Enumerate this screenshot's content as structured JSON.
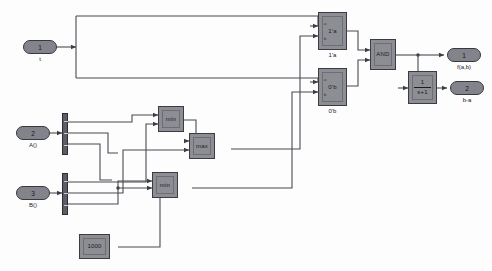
{
  "diagram": {
    "background": "#fdfdfd",
    "block_fill": "#8d8d94",
    "block_stroke": "#3b3b42",
    "wire_color": "#4a4a52"
  },
  "inputs": [
    {
      "id": "in1",
      "port_number": "1",
      "caption": "t"
    },
    {
      "id": "in2",
      "port_number": "2",
      "caption": "A()"
    },
    {
      "id": "in3",
      "port_number": "3",
      "caption": "B()"
    }
  ],
  "outputs": [
    {
      "id": "out1",
      "port_number": "1",
      "caption": "f(a,b)"
    },
    {
      "id": "out2",
      "port_number": "2",
      "caption": "b-a"
    }
  ],
  "blocks": [
    {
      "id": "rel_top",
      "label": "1'a",
      "caption": "1'a",
      "type": "relational"
    },
    {
      "id": "rel_bot",
      "label": "0'b",
      "caption": "0'b",
      "type": "relational"
    },
    {
      "id": "and",
      "label": "AND",
      "caption": "",
      "type": "logic"
    },
    {
      "id": "min_top",
      "label": "min",
      "caption": "",
      "type": "minmax"
    },
    {
      "id": "max_mid",
      "label": "max",
      "caption": "",
      "type": "minmax"
    },
    {
      "id": "min_bot",
      "label": "min",
      "caption": "",
      "type": "minmax"
    },
    {
      "id": "const",
      "label": "1000",
      "caption": "",
      "type": "constant"
    }
  ],
  "transfer_function": {
    "id": "tf1",
    "numerator": "1",
    "denominator": "s+1",
    "caption": ""
  },
  "demuxes": [
    {
      "id": "demux_a",
      "ports": 3
    },
    {
      "id": "demux_b",
      "ports": 3
    }
  ]
}
